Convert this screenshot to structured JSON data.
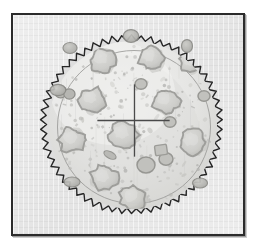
{
  "figure": {
    "caption": "",
    "medium": "grayscale halftone illustration",
    "frame": {
      "border_color": "#2b2b2b",
      "background_color": "#e9e9e9",
      "x": 11,
      "y": 13,
      "width": 234,
      "height": 223
    }
  },
  "specimen": {
    "label": "culture-plate",
    "center_x": 131,
    "center_y": 124,
    "serrated_rim": {
      "name": "crimped-edge",
      "outer_radius": 91,
      "inner_radius": 85,
      "teeth_count": 58,
      "stroke_color": "#262626",
      "stroke_width": 1.4
    },
    "inner_rim": {
      "name": "smooth-inner-circle",
      "radius": 77,
      "stroke_color": "#8d8d8d",
      "stroke_width": 0.9
    },
    "body": {
      "fill_color": "#ededec",
      "shade_color": "#d6d6d4",
      "highlight_color": "#f5f5f4"
    }
  },
  "reticle": {
    "name": "crosshair",
    "center_x": 134,
    "center_y": 120,
    "horizontal_start_x": 98,
    "horizontal_end_x": 169,
    "vertical_start_y": 85,
    "vertical_end_y": 156,
    "stroke_color": "#4a4a4a",
    "stroke_width": 1.3
  },
  "colonies": {
    "outline_color": "#9b9b98",
    "fill_color": "#d2d2cf",
    "count": 19,
    "items": [
      {
        "id": "colony-01",
        "cx": 103,
        "cy": 60,
        "r": 13,
        "type": "cloud"
      },
      {
        "id": "colony-02",
        "cx": 151,
        "cy": 58,
        "r": 12,
        "type": "cloud"
      },
      {
        "id": "colony-03",
        "cx": 190,
        "cy": 63,
        "r": 10,
        "type": "cloud"
      },
      {
        "id": "colony-04",
        "cx": 74,
        "cy": 52,
        "r": 7,
        "type": "round"
      },
      {
        "id": "colony-05",
        "cx": 92,
        "cy": 100,
        "r": 13,
        "type": "cloud"
      },
      {
        "id": "colony-06",
        "cx": 166,
        "cy": 101,
        "r": 13,
        "type": "cloud"
      },
      {
        "id": "colony-07",
        "cx": 65,
        "cy": 92,
        "r": 8,
        "type": "double"
      },
      {
        "id": "colony-08",
        "cx": 72,
        "cy": 140,
        "r": 13,
        "type": "cloud"
      },
      {
        "id": "colony-09",
        "cx": 124,
        "cy": 135,
        "r": 14,
        "type": "cloud"
      },
      {
        "id": "colony-10",
        "cx": 193,
        "cy": 142,
        "r": 13,
        "type": "cloud"
      },
      {
        "id": "colony-11",
        "cx": 104,
        "cy": 178,
        "r": 13,
        "type": "cloud"
      },
      {
        "id": "colony-12",
        "cx": 133,
        "cy": 198,
        "r": 13,
        "type": "cloud"
      },
      {
        "id": "colony-13",
        "cx": 146,
        "cy": 165,
        "r": 9,
        "type": "round"
      },
      {
        "id": "colony-14",
        "cx": 166,
        "cy": 159,
        "r": 7,
        "type": "round"
      },
      {
        "id": "colony-15",
        "cx": 161,
        "cy": 150,
        "r": 6,
        "type": "square"
      },
      {
        "id": "colony-16",
        "cx": 170,
        "cy": 122,
        "r": 6,
        "type": "round"
      },
      {
        "id": "colony-17",
        "cx": 110,
        "cy": 155,
        "r": 6,
        "type": "rod"
      },
      {
        "id": "colony-18",
        "cx": 141,
        "cy": 84,
        "r": 6,
        "type": "round"
      },
      {
        "id": "colony-19",
        "cx": 204,
        "cy": 96,
        "r": 6,
        "type": "round"
      }
    ]
  },
  "rim_colonies": {
    "note": "colonies straddling the crimped edge",
    "items": [
      {
        "id": "rim-colony-a",
        "cx": 70,
        "cy": 48
      },
      {
        "id": "rim-colony-b",
        "cx": 58,
        "cy": 90
      },
      {
        "id": "rim-colony-c",
        "cx": 187,
        "cy": 46
      },
      {
        "id": "rim-colony-d",
        "cx": 200,
        "cy": 183
      },
      {
        "id": "rim-colony-e",
        "cx": 72,
        "cy": 182
      },
      {
        "id": "rim-colony-f",
        "cx": 131,
        "cy": 36
      }
    ]
  },
  "speckles": {
    "name": "debris-speckle-field",
    "color": "#b4b4b1",
    "approx_count": 220
  }
}
